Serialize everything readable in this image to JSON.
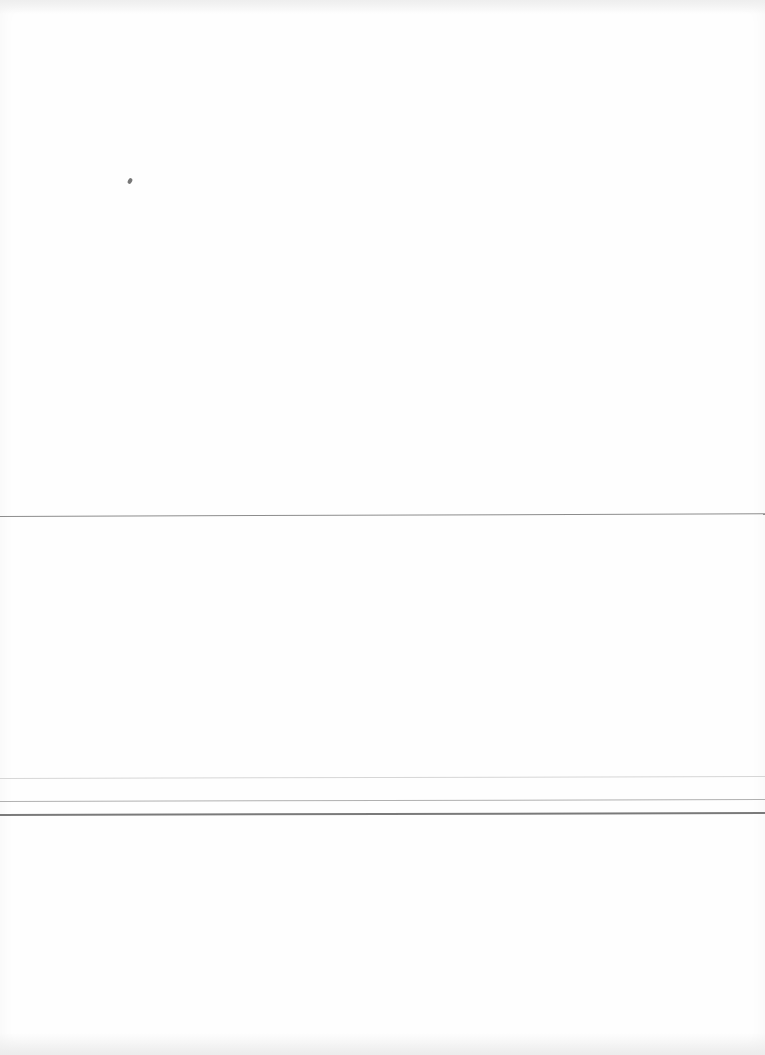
{
  "document": {
    "type": "scanned-blank-page",
    "text": "",
    "rules": [
      {
        "name": "rule-1",
        "y": 516
      },
      {
        "name": "rule-2",
        "y": 778
      },
      {
        "name": "rule-3",
        "y": 801
      },
      {
        "name": "rule-4",
        "y": 814
      }
    ],
    "caption": ""
  }
}
